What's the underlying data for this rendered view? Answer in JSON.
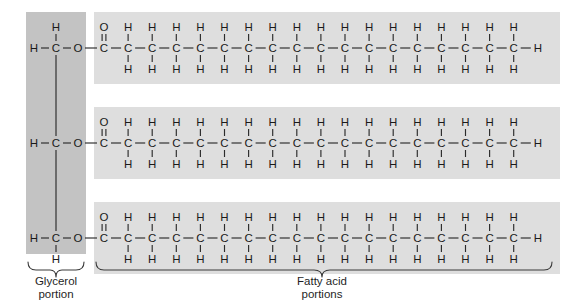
{
  "figure": {
    "background_color": "#ffffff"
  },
  "colors": {
    "glycerol_shade": "#c3c3c3",
    "fattyacid_shade": "#dedede",
    "bond": "#2b2b2b",
    "text": "#1a1a1a",
    "brace": "#3a3a3a"
  },
  "labels": {
    "glycerol_line1": "Glycerol",
    "glycerol_line2": "portion",
    "fattyacid_line1": "Fatty acid",
    "fattyacid_line2": "portions"
  },
  "atoms": {
    "carbon": "C",
    "hydrogen": "H",
    "oxygen": "O"
  },
  "glycerol": {
    "backbone_carbons": 3,
    "rows": [
      {
        "row": 1,
        "left_h": "H",
        "center": "C",
        "top_h": "H",
        "bottom_h": null,
        "ester_o": "O"
      },
      {
        "row": 2,
        "left_h": "H",
        "center": "C",
        "top_h": null,
        "bottom_h": null,
        "ester_o": "O"
      },
      {
        "row": 3,
        "left_h": "H",
        "center": "C",
        "top_h": null,
        "bottom_h": "H",
        "ester_o": "O"
      }
    ]
  },
  "fatty_acids": {
    "count": 3,
    "carbons_per_chain": 18,
    "carbonyl": {
      "carbon": "C",
      "double_bond_o": "O"
    },
    "terminal": {
      "hydrogen": "H"
    },
    "methylene_h_top": "H",
    "methylene_h_bottom": "H",
    "chains": [
      {
        "index": 1,
        "carbons": 18,
        "saturation": "saturated"
      },
      {
        "index": 2,
        "carbons": 18,
        "saturation": "saturated"
      },
      {
        "index": 3,
        "carbons": 18,
        "saturation": "saturated"
      }
    ]
  },
  "chart_data": {
    "type": "diagram",
    "components": [
      {
        "name": "Glycerol portion",
        "carbons": 3,
        "description": "Three-carbon backbone, each carbon bonded to an ester oxygen"
      },
      {
        "name": "Fatty acid portions",
        "chains": 3,
        "carbons_each": 18,
        "description": "Three saturated 18-carbon acyl chains"
      }
    ]
  }
}
